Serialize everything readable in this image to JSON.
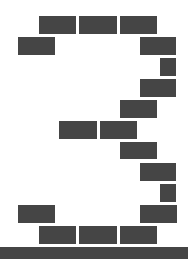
{
  "figure": {
    "digit": "3",
    "colors": {
      "brick": "#454545",
      "background": "#ffffff",
      "ground": "#454545"
    },
    "bricks": [
      {
        "x": 39,
        "y": 16,
        "w": 37,
        "h": 18
      },
      {
        "x": 79,
        "y": 16,
        "w": 38,
        "h": 18
      },
      {
        "x": 120,
        "y": 16,
        "w": 37,
        "h": 18
      },
      {
        "x": 18,
        "y": 37,
        "w": 37,
        "h": 18
      },
      {
        "x": 140,
        "y": 37,
        "w": 36,
        "h": 18
      },
      {
        "x": 160,
        "y": 58,
        "w": 16,
        "h": 18
      },
      {
        "x": 140,
        "y": 79,
        "w": 36,
        "h": 18
      },
      {
        "x": 120,
        "y": 100,
        "w": 37,
        "h": 18
      },
      {
        "x": 59,
        "y": 121,
        "w": 38,
        "h": 18
      },
      {
        "x": 100,
        "y": 121,
        "w": 37,
        "h": 18
      },
      {
        "x": 120,
        "y": 142,
        "w": 37,
        "h": 17
      },
      {
        "x": 140,
        "y": 163,
        "w": 36,
        "h": 18
      },
      {
        "x": 160,
        "y": 184,
        "w": 16,
        "h": 18
      },
      {
        "x": 18,
        "y": 205,
        "w": 37,
        "h": 18
      },
      {
        "x": 140,
        "y": 205,
        "w": 37,
        "h": 18
      },
      {
        "x": 39,
        "y": 226,
        "w": 37,
        "h": 18
      },
      {
        "x": 79,
        "y": 226,
        "w": 38,
        "h": 18
      },
      {
        "x": 120,
        "y": 226,
        "w": 37,
        "h": 18
      }
    ],
    "ground": {
      "y": 247,
      "h": 12
    }
  }
}
